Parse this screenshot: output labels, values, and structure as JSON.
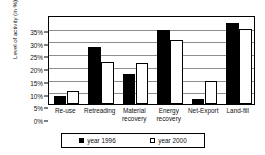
{
  "chart_data": {
    "type": "bar",
    "title": "",
    "xlabel": "",
    "ylabel": "Level of activity (in %)",
    "ylim": [
      0,
      35
    ],
    "ytick_labels": [
      "0%",
      "5%",
      "10%",
      "15%",
      "20%",
      "25%",
      "30%",
      "35%"
    ],
    "ytick_values": [
      0,
      5,
      10,
      15,
      20,
      25,
      30,
      35
    ],
    "grid": true,
    "legend_position": "bottom",
    "categories": [
      "Re-use",
      "Retreading",
      "Material recovery",
      "Energy recovery",
      "Net-Export",
      "Land-fill"
    ],
    "category_lines": [
      [
        "Re-use"
      ],
      [
        "Retreading"
      ],
      [
        "Material",
        "recovery"
      ],
      [
        "Energy",
        "recovery"
      ],
      [
        "Net-Export"
      ],
      [
        "Land-fill"
      ]
    ],
    "series": [
      {
        "name": "year 1996",
        "color": "#000000",
        "fill": "solid",
        "values": [
          3,
          22.5,
          12,
          29,
          2,
          32
        ]
      },
      {
        "name": "year 2000",
        "color": "#ffffff",
        "fill": "hollow",
        "values": [
          5,
          16.5,
          16,
          25,
          9,
          29.5
        ]
      }
    ]
  },
  "legend": {
    "entries": [
      {
        "label": "year 1996",
        "swatch": "filled-square-icon"
      },
      {
        "label": "year 2000",
        "swatch": "hollow-square-icon"
      }
    ]
  },
  "colors": {
    "axis": "#000000",
    "gridline": "#8e8e8e",
    "background": "#ffffff",
    "series_1996": "#000000",
    "series_2000": "#ffffff"
  }
}
